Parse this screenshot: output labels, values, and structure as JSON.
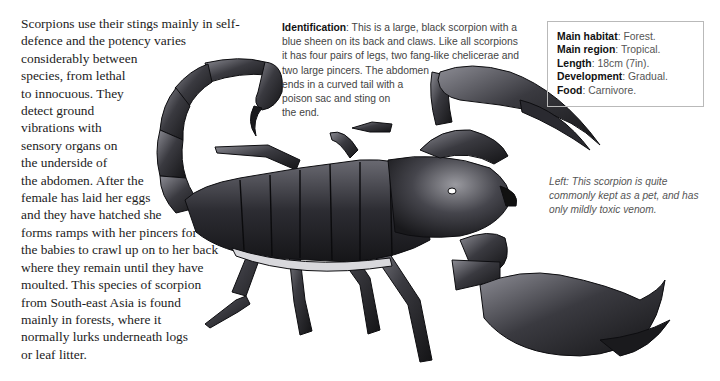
{
  "main_text": {
    "lines": [
      "Scorpions use their stings mainly in self-",
      "defence and the potency varies",
      "considerably between",
      "species, from lethal",
      "to innocuous. They",
      "detect ground",
      "vibrations with",
      "sensory organs on",
      "the underside of",
      "the abdomen. After the",
      "female has laid her eggs",
      "and they have hatched she",
      "forms ramps with her pincers for",
      "the babies to crawl up on to her back",
      "where they remain until they have",
      "moulted. This species of scorpion",
      "from South-east Asia is found",
      "mainly in forests, where it",
      "normally lurks underneath logs",
      "or leaf litter."
    ]
  },
  "identification": {
    "label": "Identification",
    "lines": [
      ": This is a large, black scorpion with a",
      "blue sheen on its back and claws. Like all scorpions",
      "it has four pairs of legs, two fang-like chelicerae and",
      "two large pincers. The abdomen",
      "ends in a curved tail with a",
      "poison sac and sting on",
      "the end."
    ]
  },
  "infobox": {
    "rows": [
      {
        "label": "Main habitat",
        "value": ": Forest."
      },
      {
        "label": "Main region",
        "value": ": Tropical."
      },
      {
        "label": "Length",
        "value": ": 18cm (7in)."
      },
      {
        "label": "Development",
        "value": ": Gradual."
      },
      {
        "label": "Food",
        "value": ": Carnivore."
      }
    ]
  },
  "caption": {
    "lines": [
      "Left: This scorpion is quite",
      "commonly kept as a pet, and has",
      "only mildly toxic venom."
    ]
  },
  "illustration": {
    "subject": "scorpion-illustration",
    "colors": {
      "body_dark": "#1e1e22",
      "body_mid": "#4a4a52",
      "highlight": "#9a9aa2"
    }
  }
}
